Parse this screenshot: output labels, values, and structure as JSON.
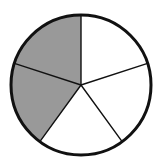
{
  "figure": {
    "kind": "fraction-circle-diagram",
    "title": "",
    "background_color": "#ffffff"
  },
  "chart_data": {
    "type": "pie",
    "title": "",
    "subtitle": "",
    "xlabel": "",
    "ylabel": "",
    "grid": false,
    "legend_position": "none",
    "total_slices": 5,
    "shaded_slices": 2,
    "unshaded_slices": 3,
    "fraction_shaded": "2/5",
    "slice_angle_degrees": 72,
    "categories": [
      "slice-1",
      "slice-2",
      "slice-3",
      "slice-4",
      "slice-5"
    ],
    "values": [
      20,
      20,
      20,
      20,
      20
    ],
    "labels": [],
    "annotations": [],
    "slices": [
      {
        "name": "slice-1",
        "start_angle": 0,
        "end_angle": 72,
        "share_percent": 20,
        "shaded": false,
        "fill": "#ffffff"
      },
      {
        "name": "slice-2",
        "start_angle": 72,
        "end_angle": 144,
        "share_percent": 20,
        "shaded": false,
        "fill": "#ffffff"
      },
      {
        "name": "slice-3",
        "start_angle": 144,
        "end_angle": 216,
        "share_percent": 20,
        "shaded": false,
        "fill": "#ffffff"
      },
      {
        "name": "slice-4",
        "start_angle": 216,
        "end_angle": 288,
        "share_percent": 20,
        "shaded": true,
        "fill": "#999999"
      },
      {
        "name": "slice-5",
        "start_angle": 288,
        "end_angle": 360,
        "share_percent": 20,
        "shaded": true,
        "fill": "#999999"
      }
    ],
    "geometry": {
      "center_x": 81,
      "center_y": 85,
      "radius": 70,
      "outline_color": "#111111",
      "outline_width": 3,
      "spoke_color": "#111111",
      "spoke_width": 1.4,
      "spoke_angles_degrees": [
        0,
        72,
        144,
        216,
        288
      ]
    },
    "colors": {
      "shaded": "#999999",
      "unshaded": "#ffffff",
      "stroke": "#111111",
      "background": "#ffffff"
    }
  }
}
